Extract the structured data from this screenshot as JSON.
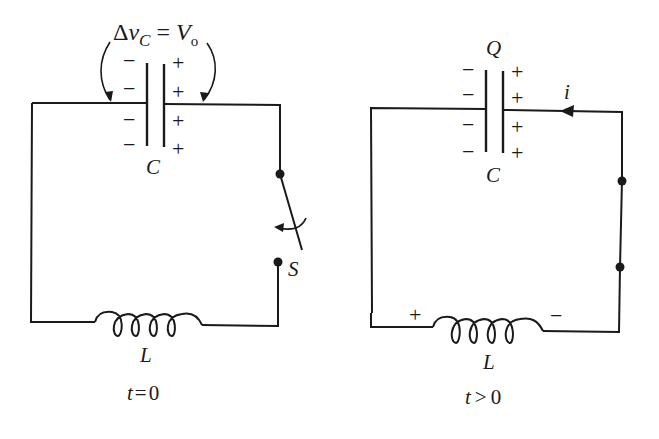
{
  "figure": {
    "panels": [
      {
        "id": "left",
        "time_label": "t = 0",
        "time_var": "t",
        "time_op": "=",
        "time_value": "0",
        "capacitor": {
          "label": "C",
          "left_signs": [
            "−",
            "−",
            "−",
            "−"
          ],
          "right_signs": [
            "+",
            "+",
            "+",
            "+"
          ]
        },
        "voltage_annotation": {
          "delta": "Δ",
          "var": "v",
          "sub": "C",
          "eq": "=",
          "rhs": "V",
          "rhs_sub": "o"
        },
        "inductor": {
          "label": "L"
        },
        "switch": {
          "label": "S",
          "state": "open"
        }
      },
      {
        "id": "right",
        "time_label": "t > 0",
        "time_var": "t",
        "time_op": ">",
        "time_value": "0",
        "capacitor": {
          "label": "C",
          "charge_label": "Q",
          "left_signs": [
            "−",
            "−",
            "−",
            "−"
          ],
          "right_signs": [
            "+",
            "+",
            "+",
            "+"
          ]
        },
        "current": {
          "label": "i",
          "direction": "leftward along top wire"
        },
        "inductor": {
          "label": "L",
          "left_sign": "+",
          "right_sign": "−"
        },
        "switch": {
          "state": "closed"
        }
      }
    ],
    "colors": {
      "ink": "#1a1a1a",
      "background": "#ffffff"
    }
  }
}
